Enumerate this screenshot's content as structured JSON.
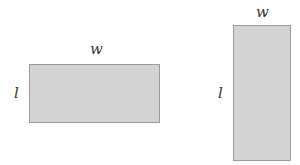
{
  "figures": [
    {
      "name": "wide-rectangle",
      "width_label": "w",
      "length_label": "l"
    },
    {
      "name": "tall-rectangle",
      "width_label": "w",
      "length_label": "l"
    }
  ],
  "colors": {
    "fill": "#d3d3d3",
    "border": "#9a9a9a",
    "text": "#333333"
  }
}
